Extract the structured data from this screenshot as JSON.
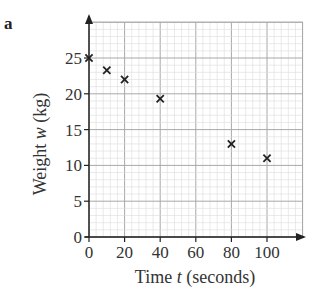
{
  "part_label": "a",
  "chart_data": {
    "type": "scatter",
    "title": "",
    "xlabel": "Time t (seconds)",
    "xlabel_parts": {
      "pre": "Time ",
      "var": "t",
      "post": " (seconds)"
    },
    "ylabel": "Weight w (kg)",
    "ylabel_parts": {
      "pre": "Weight ",
      "var": "w",
      "post": " (kg)"
    },
    "xlim": [
      0,
      120
    ],
    "ylim": [
      0,
      30
    ],
    "xticks": [
      0,
      20,
      40,
      60,
      80,
      100
    ],
    "yticks": [
      0,
      5,
      10,
      15,
      20,
      25
    ],
    "grid": true,
    "marker": "x",
    "series": [
      {
        "name": "weight",
        "x": [
          0,
          10,
          20,
          40,
          80,
          100
        ],
        "y": [
          25,
          23.3,
          22,
          19.3,
          13,
          11
        ]
      }
    ],
    "colors": {
      "grid_minor": "#dcdcdc",
      "grid_major": "#a8a8a8",
      "axis": "#222222",
      "marker": "#222222"
    }
  }
}
